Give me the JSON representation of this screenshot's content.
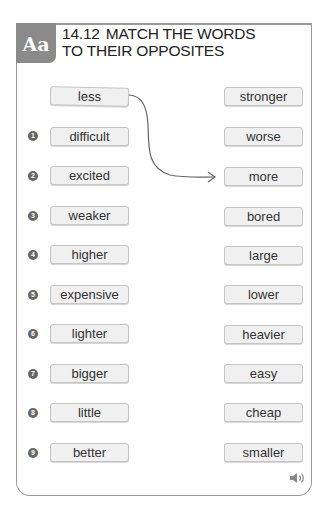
{
  "header": {
    "badge": "Aa",
    "exercise_number": "14.12",
    "title_line1": "MATCH THE WORDS",
    "title_line2": "TO THEIR OPPOSITES"
  },
  "example": {
    "left": "less",
    "right": "stronger"
  },
  "items": [
    {
      "num": "1",
      "left": "difficult",
      "right": "worse"
    },
    {
      "num": "2",
      "left": "excited",
      "right": "more"
    },
    {
      "num": "3",
      "left": "weaker",
      "right": "bored"
    },
    {
      "num": "4",
      "left": "higher",
      "right": "large"
    },
    {
      "num": "5",
      "left": "expensive",
      "right": "lower"
    },
    {
      "num": "6",
      "left": "lighter",
      "right": "heavier"
    },
    {
      "num": "7",
      "left": "bigger",
      "right": "easy"
    },
    {
      "num": "8",
      "left": "little",
      "right": "cheap"
    },
    {
      "num": "9",
      "left": "better",
      "right": "smaller"
    }
  ],
  "example_link": {
    "from": "less",
    "to": "more"
  },
  "audio_icon": "speaker-icon",
  "colors": {
    "badge": "#8a8a8a",
    "border": "#9a9a9a",
    "box_fill": "#f0f0f0",
    "number_circle": "#666666"
  }
}
